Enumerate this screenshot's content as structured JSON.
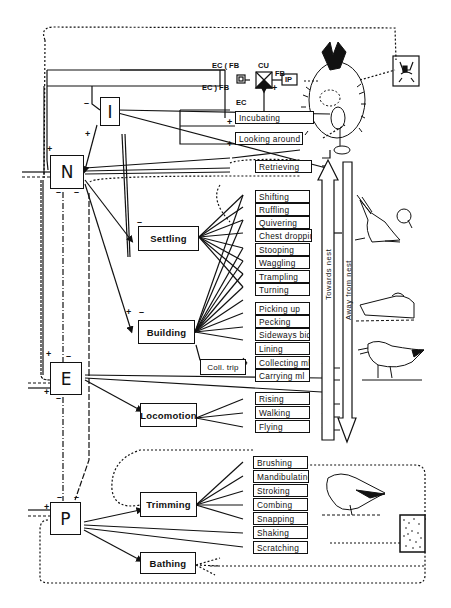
{
  "systems": {
    "N": "N",
    "I": "I",
    "E": "E",
    "P": "P"
  },
  "activities": {
    "settling": "Settling",
    "building": "Building",
    "coll_trip": "Coll. trip",
    "locomotion": "Locomotion",
    "trimming": "Trimming",
    "bathing": "Bathing"
  },
  "behaviours": {
    "incubation_group": [
      "Incubating",
      "Looking around",
      "Retrieving"
    ],
    "settling_group": [
      "Shifting",
      "Ruffling",
      "Quivering",
      "Chest dropping",
      "Stooping",
      "Waggling",
      "Trampling",
      "Turning"
    ],
    "building_group": [
      "Picking up",
      "Pecking",
      "Sideways bid",
      "Lining"
    ],
    "coll_trip_group": [
      "Collecting ml",
      "Carrying ml"
    ],
    "locomotion_group": [
      "Rising",
      "Walking",
      "Flying"
    ],
    "trimming_group": [
      "Brushing",
      "Mandibulating",
      "Stroking",
      "Combing",
      "Snapping",
      "Shaking",
      "Scratching"
    ]
  },
  "control_unit": {
    "cu_label": "CU",
    "ip_label": "IP",
    "ec_fb_top": "EC ( FB",
    "ec_fb_bottom": "EC ) FB",
    "fb_label": "FB",
    "ec_label": "EC"
  },
  "direction_arrows": {
    "towards": "Towards nest",
    "away": "Away from nest"
  },
  "signs": {
    "plus": "+",
    "minus": "–"
  },
  "illustrations": [
    "incubating-bird-on-nest",
    "bird-head-feedback-stimulus",
    "settling-bird",
    "pecking-bird",
    "bird-carrying-material",
    "preening-bird",
    "stippled-stimulus-box"
  ],
  "colors": {
    "ink": "#111111",
    "paper": "#ffffff"
  }
}
